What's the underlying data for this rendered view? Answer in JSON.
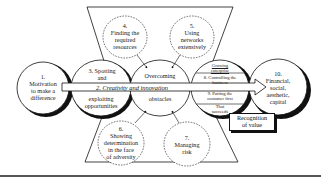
{
  "diagram": {
    "nodes": {
      "n1": {
        "label": "1.\nMotivation\nto make a\ndifference"
      },
      "n3": {
        "label": "3. Spotting\nand",
        "label_bottom": "exploiting\nopportunities"
      },
      "n4": {
        "label": "4.\nFinding the\nrequired\nresources"
      },
      "n5": {
        "label": "5.\nUsing\nnetworks\nextensively"
      },
      "n6": {
        "label": "6.\nShowing\ndetermination\nin the face\nof adversity"
      },
      "n7": {
        "label": "7.\nManaging\nrisk"
      },
      "center": {
        "label_top": "Overcoming",
        "label_bottom": "obstacles"
      },
      "n8": {
        "label_top": "Growing\nenterprise",
        "label_8": "8. Controlling the\nbusiness",
        "label_9": "9. Putting the\ncustomer first",
        "label_bottom": "That\nsucceeds"
      },
      "n10": {
        "label": "10.\nFinancial,\nsocial,\naesthetic,\ncapital"
      }
    },
    "band_label": "2. Creativity and innovation",
    "recognition_label": "Recognition\nof value",
    "colors": {
      "line": "#111111",
      "background": "#ffffff",
      "rule": "#555555"
    }
  }
}
